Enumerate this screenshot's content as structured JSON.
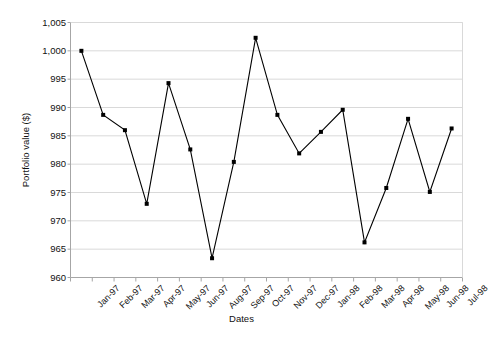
{
  "chart_data": {
    "type": "line",
    "title": "",
    "xlabel": "Dates",
    "ylabel": "Portfolio value ($)",
    "categories": [
      "Jan-97",
      "Feb-97",
      "Mar-97",
      "Apr-97",
      "May-97",
      "Jun-97",
      "Aug-97",
      "Sep-97",
      "Oct-97",
      "Nov-97",
      "Dec-97",
      "Jan-98",
      "Feb-98",
      "Mar-98",
      "Apr-98",
      "May-98",
      "Jun-98",
      "Jul-98"
    ],
    "values": [
      1000.0,
      988.7,
      986.0,
      973.0,
      994.3,
      982.6,
      963.4,
      980.4,
      1002.3,
      988.7,
      981.9,
      985.7,
      989.6,
      966.2,
      975.8,
      988.0,
      975.1,
      986.3
    ],
    "series": [
      {
        "name": "Portfolio value",
        "values": [
          1000.0,
          988.7,
          986.0,
          973.0,
          994.3,
          982.6,
          963.4,
          980.4,
          1002.3,
          988.7,
          981.9,
          985.7,
          989.6,
          966.2,
          975.8,
          988.0,
          975.1,
          986.3
        ]
      }
    ],
    "ylim": [
      960,
      1005
    ],
    "ytick_values": [
      960,
      965,
      970,
      975,
      980,
      985,
      990,
      995,
      1000,
      1005
    ],
    "ytick_labels": [
      "960",
      "965",
      "970",
      "975",
      "980",
      "985",
      "990",
      "995",
      "1,000",
      "1,005"
    ],
    "grid": "horizontal",
    "legend": "none",
    "line_color": "#000000",
    "marker": "square",
    "marker_color": "#000000",
    "gridline_color": "#d9d9d9",
    "axis_color": "#a6a6a6",
    "background": "#ffffff"
  }
}
